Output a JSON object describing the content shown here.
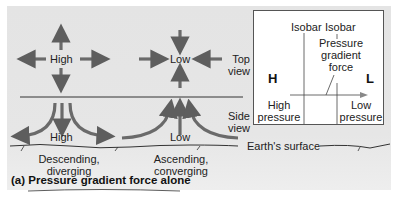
{
  "top_view": {
    "high_label": "High",
    "low_label": "Low",
    "view_label_line1": "Top",
    "view_label_line2": "view"
  },
  "side_view": {
    "high_label": "High",
    "low_label": "Low",
    "view_label_line1": "Side",
    "view_label_line2": "view"
  },
  "surface": {
    "label": "Earth's surface",
    "high_caption_line1": "Descending,",
    "high_caption_line2": "diverging",
    "low_caption_line1": "Ascending,",
    "low_caption_line2": "converging"
  },
  "inset": {
    "isobar_left": "Isobar",
    "isobar_right": "Isobar",
    "force_line1": "Pressure",
    "force_line2": "gradient",
    "force_line3": "force",
    "h_symbol": "H",
    "l_symbol": "L",
    "high_line1": "High",
    "high_line2": "pressure",
    "low_line1": "Low",
    "low_line2": "pressure"
  },
  "caption": "(a) Pressure gradient force alone",
  "colors": {
    "arrow": "#6a6a6a",
    "panel": "#e4e4e4",
    "text": "#222222"
  }
}
